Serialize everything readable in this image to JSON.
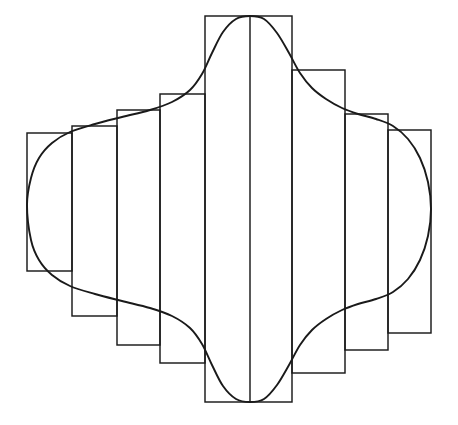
{
  "figure": {
    "background_color": "#ffffff",
    "stroke_color": "#1a1a1a",
    "canvas": {
      "width": 458,
      "height": 425
    }
  },
  "chart_data": {
    "type": "line",
    "title": "",
    "subtitle": "",
    "xlabel": "",
    "ylabel": "",
    "grid": false,
    "legend": "none",
    "xlim": [
      0,
      458
    ],
    "ylim": [
      0,
      425
    ],
    "axis_lines": [
      {
        "name": "center-vertical-axis",
        "x1": 250,
        "y1": 16,
        "x2": 250,
        "y2": 402
      }
    ],
    "rectangles": [
      {
        "index": 1,
        "name": "rect-1",
        "x": 27,
        "y": 133,
        "width": 45,
        "height": 138,
        "x_right": 72,
        "y_bottom": 271
      },
      {
        "index": 2,
        "name": "rect-2",
        "x": 72,
        "y": 126,
        "width": 45,
        "height": 190,
        "x_right": 117,
        "y_bottom": 316
      },
      {
        "index": 3,
        "name": "rect-3",
        "x": 117,
        "y": 110,
        "width": 43,
        "height": 235,
        "x_right": 160,
        "y_bottom": 345
      },
      {
        "index": 4,
        "name": "rect-4",
        "x": 160,
        "y": 94,
        "width": 45,
        "height": 269,
        "x_right": 205,
        "y_bottom": 363
      },
      {
        "index": 5,
        "name": "rect-5-center",
        "x": 205,
        "y": 16,
        "width": 87,
        "height": 386,
        "x_right": 292,
        "y_bottom": 402
      },
      {
        "index": 6,
        "name": "rect-6",
        "x": 292,
        "y": 70,
        "width": 53,
        "height": 303,
        "x_right": 345,
        "y_bottom": 373
      },
      {
        "index": 7,
        "name": "rect-7",
        "x": 345,
        "y": 114,
        "width": 43,
        "height": 236,
        "x_right": 388,
        "y_bottom": 350
      },
      {
        "index": 8,
        "name": "rect-8",
        "x": 388,
        "y": 130,
        "width": 43,
        "height": 203,
        "x_right": 431,
        "y_bottom": 333
      }
    ],
    "curve": {
      "name": "closed-curve",
      "closed": true,
      "symmetry": "horizontal-axis (top/bottom mirror)",
      "extremes": {
        "leftmost_x": 27,
        "rightmost_x": 431,
        "topmost_y": 16,
        "bottommost_y": 402,
        "top_peak_x": 250,
        "bottom_peak_x": 250
      },
      "upper_path_points": [
        [
          27,
          205
        ],
        [
          31,
          178
        ],
        [
          39,
          158
        ],
        [
          52,
          143
        ],
        [
          70,
          132
        ],
        [
          95,
          124
        ],
        [
          122,
          117
        ],
        [
          150,
          110
        ],
        [
          172,
          102
        ],
        [
          190,
          90
        ],
        [
          202,
          74
        ],
        [
          212,
          53
        ],
        [
          223,
          32
        ],
        [
          236,
          19
        ],
        [
          250,
          16
        ],
        [
          264,
          19
        ],
        [
          277,
          33
        ],
        [
          289,
          53
        ],
        [
          300,
          73
        ],
        [
          312,
          88
        ],
        [
          326,
          99
        ],
        [
          342,
          108
        ],
        [
          358,
          114
        ],
        [
          376,
          119
        ],
        [
          393,
          126
        ],
        [
          408,
          139
        ],
        [
          420,
          158
        ],
        [
          428,
          182
        ],
        [
          431,
          209
        ]
      ],
      "lower_path_points": [
        [
          431,
          209
        ],
        [
          428,
          236
        ],
        [
          420,
          260
        ],
        [
          408,
          279
        ],
        [
          393,
          292
        ],
        [
          376,
          299
        ],
        [
          358,
          304
        ],
        [
          342,
          310
        ],
        [
          326,
          319
        ],
        [
          312,
          330
        ],
        [
          300,
          345
        ],
        [
          289,
          365
        ],
        [
          277,
          385
        ],
        [
          264,
          399
        ],
        [
          250,
          402
        ],
        [
          236,
          399
        ],
        [
          223,
          386
        ],
        [
          212,
          365
        ],
        [
          202,
          344
        ],
        [
          190,
          328
        ],
        [
          172,
          316
        ],
        [
          150,
          308
        ],
        [
          122,
          301
        ],
        [
          95,
          294
        ],
        [
          70,
          286
        ],
        [
          52,
          275
        ],
        [
          39,
          260
        ],
        [
          31,
          240
        ],
        [
          27,
          213
        ]
      ]
    }
  }
}
